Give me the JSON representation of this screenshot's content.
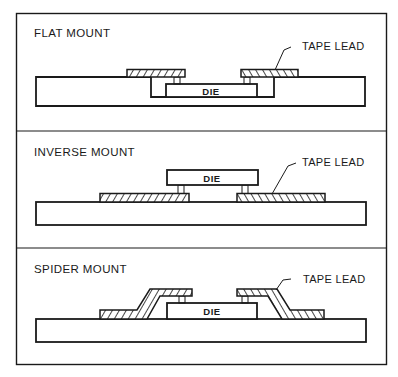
{
  "diagram": {
    "panels": [
      {
        "id": "flat",
        "title": "FLAT MOUNT",
        "die_label": "DIE",
        "callout": "TAPE LEAD",
        "description": "Die sits in a cavity in the substrate; tape leads lie flat on substrate surface and bond to die top"
      },
      {
        "id": "inverse",
        "title": "INVERSE MOUNT",
        "die_label": "DIE",
        "callout": "TAPE LEAD",
        "description": "Die is inverted above tape leads, which lie flat on the substrate"
      },
      {
        "id": "spider",
        "title": "SPIDER MOUNT",
        "die_label": "DIE",
        "callout": "TAPE LEAD",
        "description": "Die sits on substrate; tape leads are formed up and over to bond to die top"
      }
    ]
  }
}
